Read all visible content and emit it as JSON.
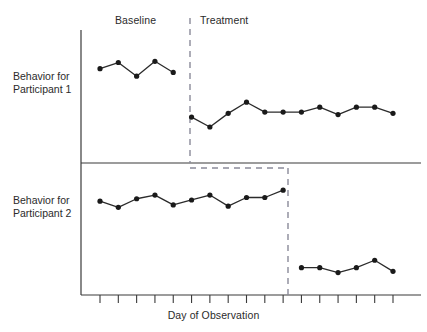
{
  "figure": {
    "phase_labels": {
      "baseline": "Baseline",
      "treatment": "Treatment"
    },
    "y_labels": {
      "participant1_line1": "Behavior for",
      "participant1_line2": "Participant 1",
      "participant2_line1": "Behavior for",
      "participant2_line2": "Participant 2"
    },
    "x_axis_title": "Day of Observation",
    "colors": {
      "line": "#2b2b2b",
      "marker": "#1a1a1a",
      "axis": "#3a3a3a",
      "phase_change_line": "#8a8a99",
      "background": "#ffffff"
    }
  },
  "chart_data": {
    "type": "line",
    "title": "",
    "subtitle": "",
    "xlabel": "Day of Observation",
    "ylabel": "",
    "grid": false,
    "legend": "none",
    "design": "multiple-baseline across participants",
    "x": [
      1,
      2,
      3,
      4,
      5,
      6,
      7,
      8,
      9,
      10,
      11,
      12,
      13,
      14,
      15,
      16,
      17
    ],
    "xlim": [
      0.5,
      17.5
    ],
    "ylim": [
      0,
      100
    ],
    "annotations": [
      {
        "text": "Baseline",
        "x": 3,
        "panel": "top"
      },
      {
        "text": "Treatment",
        "x": 8,
        "panel": "top"
      }
    ],
    "panels": [
      {
        "name": "Behavior for Participant 1",
        "phase_change_after_x": 5,
        "series": [
          {
            "name": "Baseline",
            "phase": "baseline",
            "x": [
              1,
              2,
              3,
              4,
              5
            ],
            "values": [
              72,
              77,
              66,
              78,
              69
            ]
          },
          {
            "name": "Treatment",
            "phase": "treatment",
            "x": [
              6,
              7,
              8,
              9,
              10,
              11,
              12,
              13,
              14,
              15,
              16,
              17
            ],
            "values": [
              33,
              25,
              36,
              45,
              37,
              37,
              37,
              41,
              35,
              41,
              41,
              36
            ]
          }
        ]
      },
      {
        "name": "Behavior for Participant 2",
        "phase_change_after_x": 11,
        "series": [
          {
            "name": "Baseline",
            "phase": "baseline",
            "x": [
              1,
              2,
              3,
              4,
              5,
              6,
              7,
              8,
              9,
              10,
              11
            ],
            "values": [
              73,
              68,
              75,
              78,
              70,
              74,
              78,
              69,
              76,
              76,
              82
            ]
          },
          {
            "name": "Treatment",
            "phase": "treatment",
            "x": [
              12,
              13,
              14,
              15,
              16,
              17
            ],
            "values": [
              19,
              19,
              15,
              19,
              25,
              16
            ]
          }
        ]
      }
    ],
    "tick_count": 17
  }
}
